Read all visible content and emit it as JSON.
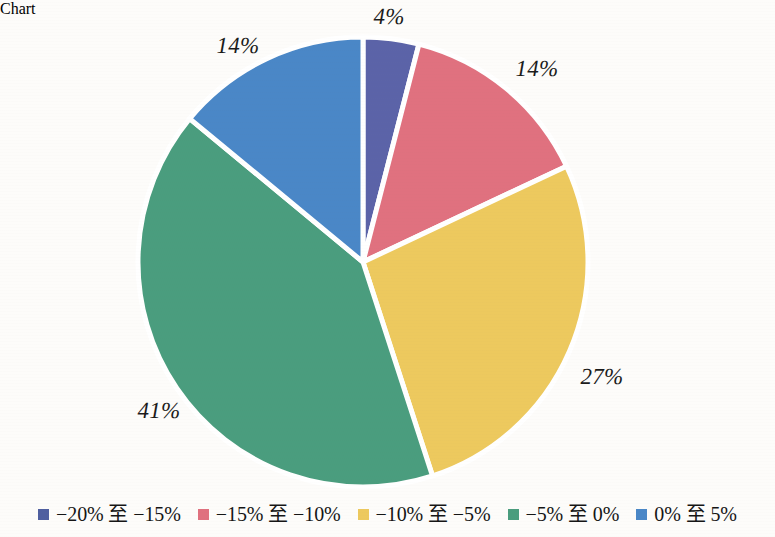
{
  "chart_data": {
    "type": "pie",
    "title": "",
    "subtitle": "",
    "xlabel": "",
    "ylabel": "",
    "legend_position": "bottom",
    "grid": false,
    "categories": [
      "−20% 至 −15%",
      "−15% 至 −10%",
      "−10% 至 −5%",
      "−5% 至 0%",
      "0% 至 5%"
    ],
    "values": [
      4,
      14,
      27,
      41,
      14
    ],
    "value_labels": [
      "4%",
      "14%",
      "27%",
      "41%",
      "14%"
    ],
    "colors": [
      "#5b63a8",
      "#e0717f",
      "#edc95e",
      "#4a9d7e",
      "#4a87c7"
    ],
    "slice_order_clockwise_from_top": [
      "−20% 至 −15%",
      "−15% 至 −10%",
      "−10% 至 −5%",
      "−5% 至 0%",
      "0% 至 5%"
    ],
    "separator_color": "#ffffff",
    "background_color": "#fdfcfa"
  },
  "labels": [
    {
      "text": "4%",
      "x": 389,
      "y": 17
    },
    {
      "text": "14%",
      "x": 238,
      "y": 46
    },
    {
      "text": "14%",
      "x": 537,
      "y": 69
    },
    {
      "text": "27%",
      "x": 602,
      "y": 377
    },
    {
      "text": "41%",
      "x": 159,
      "y": 411
    }
  ],
  "legend": {
    "items": [
      {
        "label": "−20% 至 −15%",
        "color": "#4f5fa0"
      },
      {
        "label": "−15% 至 −10%",
        "color": "#e0717f"
      },
      {
        "label": "−10% 至 −5%",
        "color": "#edc95e"
      },
      {
        "label": "−5% 至 0%",
        "color": "#4a9d7e"
      },
      {
        "label": "0% 至 5%",
        "color": "#4a87c7"
      }
    ]
  }
}
